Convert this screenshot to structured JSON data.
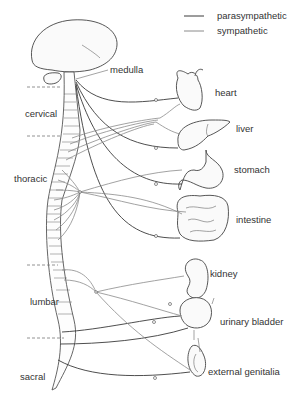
{
  "legend": {
    "items": [
      {
        "label": "parasympathetic",
        "color": "#3a3a3a"
      },
      {
        "label": "sympathetic",
        "color": "#8a8a8a"
      }
    ]
  },
  "brain": {
    "label": "medulla"
  },
  "regions": [
    {
      "label": "cervical"
    },
    {
      "label": "thoracic"
    },
    {
      "label": "lumbar"
    },
    {
      "label": "sacral"
    }
  ],
  "organs": [
    {
      "label": "heart"
    },
    {
      "label": "liver"
    },
    {
      "label": "stomach"
    },
    {
      "label": "intestine"
    },
    {
      "label": "kidney"
    },
    {
      "label": "urinary  bladder"
    },
    {
      "label": "external genitalia"
    }
  ]
}
